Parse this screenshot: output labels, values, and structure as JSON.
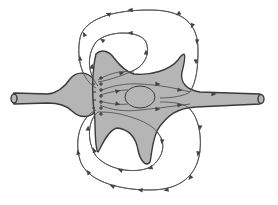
{
  "diagram": {
    "title": "",
    "colors": {
      "background": "#ffffff",
      "cell_fill": "#b5b5b5",
      "cell_stroke": "#3a3a3a",
      "line": "#555555"
    },
    "presynaptic_terminal": {
      "path": "M14,93 C12,96 12,101 14,104 L48,103 C58,103 66,105 72,111 C80,119 92,118 96,110 C100,101 99,88 94,80 C88,71 76,71 70,79 C66,85 58,93 48,94 Z",
      "cap": {
        "cx": 14,
        "cy": 98.5,
        "rx": 3,
        "ry": 4.5
      }
    },
    "postsynaptic_cell": {
      "path": "M96,54 C102,48 110,52 114,58 C120,66 126,72 134,74 C150,76 170,70 178,60 C183,53 188,48 182,72 C180,82 186,90 200,92 L260,94 C263,96 263,102 260,104 L196,107 C176,108 168,116 160,126 C152,136 152,154 150,162 C146,168 140,160 138,150 C136,138 130,130 118,128 C108,128 100,150 98,152 C94,148 96,122 94,110 C92,96 92,70 96,54 Z",
      "axon_cap": {
        "cx": 261,
        "cy": 99,
        "rx": 3,
        "ry": 4.5
      },
      "inner_oval": {
        "cx": 140,
        "cy": 97,
        "rx": 15,
        "ry": 11
      }
    },
    "field_lines": [
      {
        "name": "outer-top-loop",
        "path": "M96,88 C82,80 76,58 80,38 C84,20 110,10 150,10 C190,10 198,30 198,50 C198,70 196,82 190,92 C184,96 172,98 160,98"
      },
      {
        "name": "inner-top-loop",
        "path": "M98,86 C88,74 86,56 96,42 C108,30 140,30 146,42 C150,52 146,62 138,68 C128,74 110,80 98,82"
      },
      {
        "name": "inner-bottom-loop",
        "path": "M98,112 C88,120 86,140 96,156 C110,172 140,174 152,166 C162,158 166,146 160,136 C154,124 136,118 120,114 C110,112 102,112 98,112"
      },
      {
        "name": "outer-bottom-loop",
        "path": "M96,110 C80,118 74,140 80,160 C86,180 116,190 150,190 C184,190 198,172 200,150 C202,130 196,112 186,106 C178,102 166,102 160,102"
      },
      {
        "name": "cell-interior-upper",
        "path": "M100,91 C110,86 126,83 140,84 C160,85 175,88 190,92"
      },
      {
        "name": "cell-interior-lower",
        "path": "M100,105 C110,110 126,112 140,110 C160,108 175,106 190,104"
      },
      {
        "name": "cell-interior-mid-upper",
        "path": "M100,95 C110,92 120,90 128,90"
      },
      {
        "name": "cell-interior-mid-lower",
        "path": "M100,101 C110,104 120,105 128,104"
      },
      {
        "name": "upper-cell-line",
        "path": "M98,80 C108,74 120,70 134,72"
      }
    ],
    "arrows": [
      {
        "x": 108,
        "y": 14,
        "angle": 200
      },
      {
        "x": 130,
        "y": 10,
        "angle": 180
      },
      {
        "x": 178,
        "y": 14,
        "angle": 150
      },
      {
        "x": 192,
        "y": 26,
        "angle": 115
      },
      {
        "x": 197,
        "y": 42,
        "angle": 95
      },
      {
        "x": 196,
        "y": 62,
        "angle": 85
      },
      {
        "x": 84,
        "y": 34,
        "angle": 240
      },
      {
        "x": 80,
        "y": 58,
        "angle": 265
      },
      {
        "x": 130,
        "y": 33,
        "angle": 180
      },
      {
        "x": 102,
        "y": 40,
        "angle": 215
      },
      {
        "x": 146,
        "y": 52,
        "angle": 270
      },
      {
        "x": 92,
        "y": 66,
        "angle": 280
      },
      {
        "x": 158,
        "y": 84,
        "angle": 0
      },
      {
        "x": 180,
        "y": 90,
        "angle": 10
      },
      {
        "x": 214,
        "y": 94,
        "angle": 0
      },
      {
        "x": 158,
        "y": 109,
        "angle": 0
      },
      {
        "x": 180,
        "y": 105,
        "angle": 350
      },
      {
        "x": 118,
        "y": 91,
        "angle": 345
      },
      {
        "x": 118,
        "y": 104,
        "angle": 15
      },
      {
        "x": 200,
        "y": 128,
        "angle": 95
      },
      {
        "x": 198,
        "y": 154,
        "angle": 100
      },
      {
        "x": 190,
        "y": 178,
        "angle": 130
      },
      {
        "x": 166,
        "y": 190,
        "angle": 170
      },
      {
        "x": 140,
        "y": 190,
        "angle": 185
      },
      {
        "x": 112,
        "y": 186,
        "angle": 200
      },
      {
        "x": 88,
        "y": 172,
        "angle": 235
      },
      {
        "x": 78,
        "y": 152,
        "angle": 260
      },
      {
        "x": 162,
        "y": 142,
        "angle": 95
      },
      {
        "x": 150,
        "y": 168,
        "angle": 160
      },
      {
        "x": 120,
        "y": 170,
        "angle": 200
      },
      {
        "x": 94,
        "y": 150,
        "angle": 250
      },
      {
        "x": 88,
        "y": 128,
        "angle": 275
      },
      {
        "x": 122,
        "y": 73,
        "angle": 350
      }
    ],
    "membrane_marks": [
      {
        "x": 101,
        "y": 78
      },
      {
        "x": 101,
        "y": 84
      },
      {
        "x": 101,
        "y": 90
      },
      {
        "x": 101,
        "y": 96
      },
      {
        "x": 101,
        "y": 102
      },
      {
        "x": 101,
        "y": 108
      },
      {
        "x": 101,
        "y": 114
      }
    ],
    "presynaptic_marks": [
      {
        "x": 94,
        "y": 84
      },
      {
        "x": 95,
        "y": 92
      },
      {
        "x": 95,
        "y": 100
      },
      {
        "x": 94,
        "y": 108
      }
    ]
  }
}
